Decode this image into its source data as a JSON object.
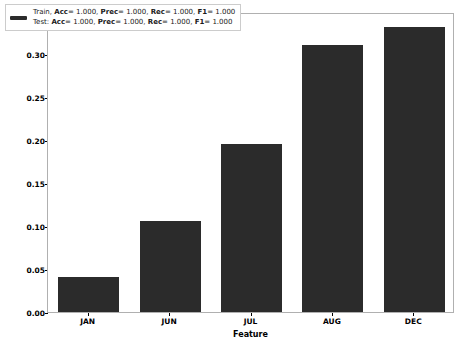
{
  "chart_data": {
    "type": "bar",
    "title": "",
    "categories": [
      "JAN",
      "JUN",
      "JUL",
      "AUG",
      "DEC"
    ],
    "values": [
      0.041,
      0.106,
      0.196,
      0.311,
      0.333
    ],
    "series": [
      {
        "name": "Relative Importance",
        "values": [
          0.041,
          0.106,
          0.196,
          0.311,
          0.333
        ]
      }
    ],
    "xlabel": "Feature",
    "ylabel": "Relative Importance",
    "ylim": [
      0.0,
      0.35
    ],
    "yticks": [
      0.0,
      0.05,
      0.1,
      0.15,
      0.2,
      0.25,
      0.3,
      0.35
    ],
    "ytick_labels": [
      "0.00",
      "0.05",
      "0.10",
      "0.15",
      "0.20",
      "0.25",
      "0.30",
      "0.35"
    ],
    "grid": false,
    "legend_position": "upper left",
    "bar_color": "#2b2b2b",
    "bar_width_fraction": 0.75
  },
  "legend": {
    "swatch_color": "#2b2b2b",
    "lines": [
      {
        "id": "train",
        "prefix": "Train,",
        "metrics": [
          {
            "name": "Acc",
            "sep": "= ",
            "value": "1.000",
            "trail": ","
          },
          {
            "name": "Prec",
            "sep": "= ",
            "value": "1.000",
            "trail": ","
          },
          {
            "name": "Rec",
            "sep": "= ",
            "value": "1.000",
            "trail": ","
          },
          {
            "name": "F1",
            "sep": "= ",
            "value": "1.000",
            "trail": ""
          }
        ],
        "full_text": "Train, Acc= 1.000, Prec= 1.000, Rec= 1.000, F1= 1.000"
      },
      {
        "id": "test",
        "prefix": "Test:",
        "metrics": [
          {
            "name": "Acc",
            "sep": "= ",
            "value": "1.000",
            "trail": ","
          },
          {
            "name": "Prec",
            "sep": "= ",
            "value": "1.000",
            "trail": ","
          },
          {
            "name": "Rec",
            "sep": "= ",
            "value": "1.000",
            "trail": ","
          },
          {
            "name": "F1",
            "sep": "= ",
            "value": "1.000",
            "trail": ""
          }
        ],
        "full_text": "Test: Acc= 1.000, Prec= 1.000, Rec= 1.000, F1= 1.000"
      }
    ]
  },
  "colors": {
    "background": "#ffffff",
    "bar": "#2b2b2b",
    "axis_border": "#b0b0b0",
    "text": "#000000"
  }
}
